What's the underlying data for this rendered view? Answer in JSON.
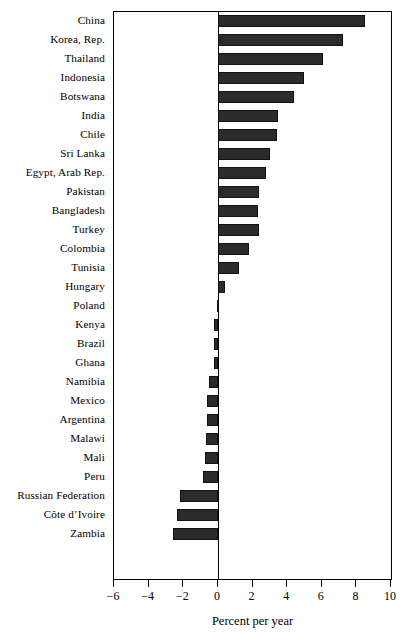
{
  "chart_data": {
    "type": "bar",
    "orientation": "horizontal",
    "title": "",
    "subtitle": "",
    "xlabel": "Percent per year",
    "ylabel": "",
    "xlim": [
      -6,
      10
    ],
    "xticks": [
      -6,
      -4,
      -2,
      0,
      2,
      4,
      6,
      8,
      10
    ],
    "xtick_labels": [
      "−6",
      "−4",
      "−2",
      "0",
      "2",
      "4",
      "6",
      "8",
      "10"
    ],
    "grid": false,
    "legend": null,
    "zero_reference_line": true,
    "bar_color": "#2b2b2b",
    "frame_color": "#000000",
    "background": "#ffffff",
    "categories": [
      "China",
      "Korea, Rep.",
      "Thailand",
      "Indonesia",
      "Botswana",
      "India",
      "Chile",
      "Sri Lanka",
      "Egypt, Arab Rep.",
      "Pakistan",
      "Bangladesh",
      "Turkey",
      "Colombia",
      "Tunisia",
      "Hungary",
      "Poland",
      "Kenya",
      "Brazil",
      "Ghana",
      "Namibia",
      "Mexico",
      "Argentina",
      "Malawi",
      "Mali",
      "Peru",
      "Russian Federation",
      "Côte d’Ivoire",
      "Zambia"
    ],
    "values": [
      8.5,
      7.2,
      6.1,
      5.0,
      4.4,
      3.5,
      3.4,
      3.0,
      2.8,
      2.4,
      2.3,
      2.4,
      1.8,
      1.2,
      0.4,
      -0.05,
      -0.2,
      -0.2,
      -0.25,
      -0.5,
      -0.6,
      -0.65,
      -0.7,
      -0.75,
      -0.85,
      -2.2,
      -2.35,
      -2.6
    ]
  }
}
